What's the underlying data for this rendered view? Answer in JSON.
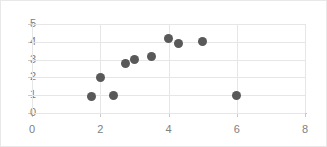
{
  "chart_data": {
    "type": "scatter",
    "title": "",
    "xlabel": "",
    "ylabel": "",
    "xlim": [
      0,
      8
    ],
    "ylim": [
      0,
      5
    ],
    "xticks": [
      0,
      2,
      4,
      6,
      8
    ],
    "yticks": [
      0,
      1,
      2,
      3,
      4,
      5
    ],
    "xticklabels": [
      "0",
      "2",
      "4",
      "6",
      "8"
    ],
    "yticklabels": [
      "0",
      "1",
      "2",
      "3",
      "4",
      "5"
    ],
    "grid": true,
    "legend": false,
    "marker_color": "#595959",
    "gridline_color": "#e6e6e6",
    "axis_color": "#c9c9c9",
    "tick_label_color": "#808080",
    "series": [
      {
        "name": "series-1",
        "points": [
          {
            "x": 1.75,
            "y": 0.9
          },
          {
            "x": 2.0,
            "y": 2.0
          },
          {
            "x": 2.4,
            "y": 1.0
          },
          {
            "x": 2.75,
            "y": 2.8
          },
          {
            "x": 3.0,
            "y": 3.0
          },
          {
            "x": 3.5,
            "y": 3.2
          },
          {
            "x": 4.0,
            "y": 4.2
          },
          {
            "x": 4.3,
            "y": 3.9
          },
          {
            "x": 5.0,
            "y": 4.0
          },
          {
            "x": 6.0,
            "y": 1.0
          }
        ]
      }
    ]
  }
}
